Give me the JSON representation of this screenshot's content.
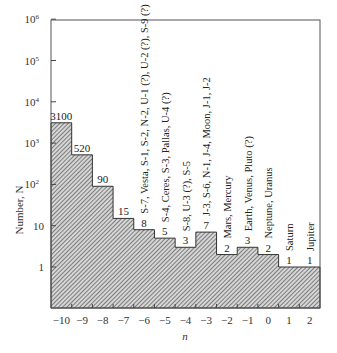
{
  "chart_data": {
    "type": "bar",
    "subtype": "histogram",
    "title": "",
    "xlabel": "n",
    "ylabel": "Number, N",
    "yscale": "log",
    "ylim": [
      0.1,
      1000000
    ],
    "y_ticks": [
      {
        "base": "10",
        "exp": "6",
        "value": 1000000
      },
      {
        "base": "10",
        "exp": "5",
        "value": 100000
      },
      {
        "base": "10",
        "exp": "4",
        "value": 10000
      },
      {
        "base": "10",
        "exp": "3",
        "value": 1000
      },
      {
        "base": "10",
        "exp": "2",
        "value": 100
      },
      {
        "base": "10",
        "exp": "",
        "value": 10
      },
      {
        "base": "1",
        "exp": "",
        "value": 1
      }
    ],
    "categories": [
      "−10",
      "−9",
      "−8",
      "−7",
      "−6",
      "−5",
      "−4",
      "−3",
      "−2",
      "−1",
      "0",
      "1",
      "2"
    ],
    "values": [
      3100,
      520,
      90,
      15,
      8,
      5,
      3,
      7,
      2,
      3,
      2,
      1,
      1
    ],
    "value_labels": [
      "3100",
      "520",
      "90",
      "15",
      "8",
      "5",
      "3",
      "7",
      "2",
      "3",
      "2",
      "1",
      "1"
    ],
    "annotations": [
      {
        "n": -6,
        "text": "S-7, Vesta, S-1, S-2, N-2, U-1 (?), U-2 (?), S-9 (?)"
      },
      {
        "n": -5,
        "text": "S-4, Ceres, S-3, Pallas, U-4 (?)"
      },
      {
        "n": -4,
        "text": "S-8, U-3 (?), S-5"
      },
      {
        "n": -3,
        "text": "J-3, S-6, N-1, J-4, Moon, J-1, J-2"
      },
      {
        "n": -2,
        "text": "Mars, Mercury"
      },
      {
        "n": -1,
        "text": "Earth, Venus, Pluto (?)"
      },
      {
        "n": 0,
        "text": "Neptune, Uranus"
      },
      {
        "n": 1,
        "text": "Saturn"
      },
      {
        "n": 2,
        "text": "Jupiter"
      }
    ],
    "fill": "hatched",
    "grid": false,
    "legend": null
  }
}
